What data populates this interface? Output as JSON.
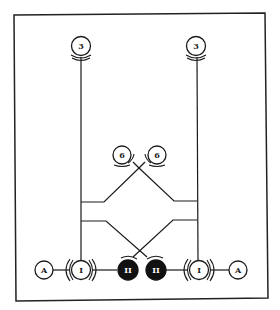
{
  "diagram": {
    "title": "",
    "nodes": {
      "top_left": {
        "label": "3"
      },
      "top_right": {
        "label": "3"
      },
      "mid_left": {
        "label": "6"
      },
      "mid_right": {
        "label": "6"
      },
      "bottom_left_a": {
        "label": "A"
      },
      "bottom_left_i": {
        "label": "I"
      },
      "bottom_center_left_ii": {
        "label": "II"
      },
      "bottom_center_right_ii": {
        "label": "II"
      },
      "bottom_right_i": {
        "label": "I"
      },
      "bottom_right_a": {
        "label": "A"
      }
    },
    "colors": {
      "line": "#1a1a1a",
      "filled_node": "#111111",
      "open_node": "#ffffff",
      "background": "#ffffff"
    }
  }
}
